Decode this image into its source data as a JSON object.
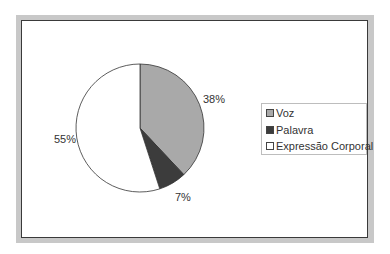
{
  "chart_data": {
    "type": "pie",
    "title": "",
    "categories": [
      "Voz",
      "Palavra",
      "Expressão Corporal"
    ],
    "values": [
      38,
      7,
      55
    ],
    "labels": [
      "38%",
      "7%",
      "55%"
    ],
    "colors": [
      "#a9a9a9",
      "#3c3c3c",
      "#ffffff"
    ],
    "legend_position": "right",
    "start_angle_deg": 0,
    "direction": "clockwise"
  },
  "legend": {
    "items": [
      {
        "label": "Voz",
        "color": "#a9a9a9"
      },
      {
        "label": "Palavra",
        "color": "#3c3c3c"
      },
      {
        "label": "Expressão Corporal",
        "color": "#ffffff"
      }
    ]
  }
}
